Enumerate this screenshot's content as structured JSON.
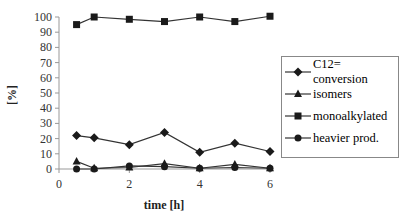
{
  "chart_data": {
    "type": "line",
    "title": "",
    "xlabel": "time [h]",
    "ylabel": "[%]",
    "xlim": [
      0,
      6
    ],
    "ylim": [
      0,
      100
    ],
    "x_ticks": [
      0,
      2,
      4,
      6
    ],
    "y_ticks": [
      0,
      10,
      20,
      30,
      40,
      50,
      60,
      70,
      80,
      90,
      100
    ],
    "grid": false,
    "legend_position": "right",
    "x": [
      0.5,
      1,
      2,
      3,
      4,
      5,
      6
    ],
    "series": [
      {
        "name": "C12= conversion",
        "marker": "diamond",
        "values": [
          22,
          20.5,
          16,
          24,
          11,
          17,
          11.5
        ]
      },
      {
        "name": "isomers",
        "marker": "triangle",
        "values": [
          5,
          0.5,
          1,
          3.5,
          0.5,
          3,
          0.5
        ]
      },
      {
        "name": "monoalkylated",
        "marker": "square",
        "values": [
          95,
          100,
          98.5,
          97,
          100,
          97,
          100.5
        ]
      },
      {
        "name": "heavier prod.",
        "marker": "circle",
        "values": [
          0,
          0,
          2,
          1.5,
          0.5,
          1,
          0.5
        ]
      }
    ]
  },
  "colors": {
    "line": "#333333",
    "marker": "#1a1a1a",
    "axis": "#999999"
  }
}
